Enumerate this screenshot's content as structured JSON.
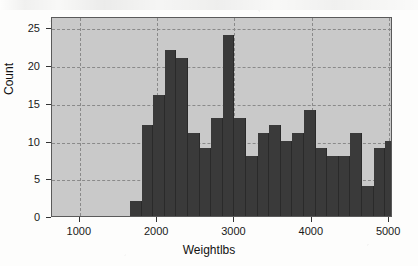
{
  "chart_data": {
    "type": "bar",
    "title": "",
    "subtitle": "",
    "xlabel": "Weightlbs",
    "ylabel": "Count",
    "xlim": [
      640,
      5050
    ],
    "ylim": [
      0,
      26.5
    ],
    "grid": true,
    "legend": null,
    "bin_width": 150,
    "bin_starts": [
      1650,
      1800,
      1950,
      2100,
      2250,
      2400,
      2550,
      2700,
      2850,
      3000,
      3150,
      3300,
      3450,
      3600,
      3750,
      3900,
      4050,
      4200,
      4350,
      4500,
      4650,
      4800
    ],
    "categories": [
      "1650-1800",
      "1800-1950",
      "1950-2100",
      "2100-2250",
      "2250-2400",
      "2400-2550",
      "2550-2700",
      "2700-2850",
      "2850-3000",
      "3000-3150",
      "3150-3300",
      "3300-3450",
      "3450-3600",
      "3600-3750",
      "3750-3900",
      "3900-4050",
      "4050-4200",
      "4200-4350",
      "4350-4500",
      "4500-4650",
      "4650-4800",
      "4800-4950"
    ],
    "values": [
      2,
      12,
      16,
      22,
      21,
      11,
      9,
      13,
      24,
      13,
      11,
      12,
      10,
      11,
      14,
      9,
      8,
      8,
      11,
      4,
      9,
      10
    ],
    "bars": [
      {
        "x_start": 1650,
        "x_end": 1800,
        "count": 2
      },
      {
        "x_start": 1800,
        "x_end": 1950,
        "count": 12
      },
      {
        "x_start": 1950,
        "x_end": 2100,
        "count": 16
      },
      {
        "x_start": 2100,
        "x_end": 2250,
        "count": 22
      },
      {
        "x_start": 2250,
        "x_end": 2400,
        "count": 21
      },
      {
        "x_start": 2400,
        "x_end": 2550,
        "count": 11
      },
      {
        "x_start": 2550,
        "x_end": 2700,
        "count": 9
      },
      {
        "x_start": 2700,
        "x_end": 2850,
        "count": 13
      },
      {
        "x_start": 2850,
        "x_end": 3000,
        "count": 24
      },
      {
        "x_start": 3000,
        "x_end": 3150,
        "count": 13
      },
      {
        "x_start": 3150,
        "x_end": 3300,
        "count": 8
      },
      {
        "x_start": 3300,
        "x_end": 3450,
        "count": 11
      },
      {
        "x_start": 3450,
        "x_end": 3600,
        "count": 12
      },
      {
        "x_start": 3600,
        "x_end": 3750,
        "count": 10
      },
      {
        "x_start": 3750,
        "x_end": 3900,
        "count": 11
      },
      {
        "x_start": 3900,
        "x_end": 4050,
        "count": 14
      },
      {
        "x_start": 4050,
        "x_end": 4200,
        "count": 9
      },
      {
        "x_start": 4200,
        "x_end": 4350,
        "count": 8
      },
      {
        "x_start": 4350,
        "x_end": 4500,
        "count": 8
      },
      {
        "x_start": 4500,
        "x_end": 4650,
        "count": 11
      },
      {
        "x_start": 4650,
        "x_end": 4800,
        "count": 4
      },
      {
        "x_start": 4800,
        "x_end": 4950,
        "count": 9
      },
      {
        "x_start": 4950,
        "x_end": 5100,
        "count": 10
      },
      {
        "x_start": 5100,
        "x_end": 5250,
        "count": 11
      },
      {
        "x_start": 5250,
        "x_end": 5400,
        "count": 5
      },
      {
        "x_start": 5400,
        "x_end": 5550,
        "count": 4
      },
      {
        "x_start": 5550,
        "x_end": 5700,
        "count": 1
      },
      {
        "x_start": 5700,
        "x_end": 5850,
        "count": 4
      }
    ],
    "yticks": [
      0,
      5,
      10,
      15,
      20,
      25
    ],
    "ytick_labels": [
      "0",
      "5",
      "10",
      "15",
      "20",
      "25"
    ],
    "xticks": [
      1000,
      2000,
      3000,
      4000,
      5000
    ],
    "xtick_labels": [
      "1000",
      "2000",
      "3000",
      "4000",
      "5000"
    ],
    "colors": {
      "bar": "#3a3a3a",
      "plot_background": "#c9c9c9",
      "grid": "#8a8a8a",
      "axis": "#5a5a5a",
      "text": "#111111",
      "figure_background": "#fdfdfc"
    }
  },
  "axes": {
    "y_axis_title": "Count",
    "x_axis_title": "Weightlbs"
  }
}
